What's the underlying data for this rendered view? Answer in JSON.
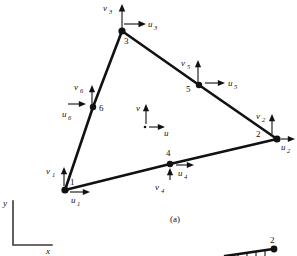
{
  "figure": {
    "caption_a": "(a)",
    "background_color": "#ffffff",
    "line_color": "#111111",
    "global_axes": {
      "x_label": "x",
      "y_label": "y"
    },
    "local_axes": {
      "u_label": "u",
      "v_label": "v"
    },
    "element_type": "six-node triangular element",
    "nodes": [
      {
        "id": "1",
        "label": "1",
        "x": 65,
        "y": 190,
        "u_label": "u",
        "u_sub": "1",
        "v_label": "v",
        "v_sub": "1",
        "u_dir": "right",
        "v_dir": "up"
      },
      {
        "id": "2",
        "label": "2",
        "x": 277,
        "y": 139,
        "u_label": "u",
        "u_sub": "2",
        "v_label": "v",
        "v_sub": "2",
        "u_dir": "right",
        "v_dir": "up"
      },
      {
        "id": "3",
        "label": "3",
        "x": 122,
        "y": 31,
        "u_label": "u",
        "u_sub": "3",
        "v_label": "v",
        "v_sub": "3",
        "u_dir": "right",
        "v_dir": "up"
      },
      {
        "id": "4",
        "label": "4",
        "x": 170,
        "y": 164,
        "u_label": "u",
        "u_sub": "4",
        "v_label": "v",
        "v_sub": "4",
        "u_dir": "right",
        "v_dir": "up"
      },
      {
        "id": "5",
        "label": "5",
        "x": 199,
        "y": 85,
        "u_label": "u",
        "u_sub": "5",
        "v_label": "v",
        "v_sub": "5",
        "u_dir": "right",
        "v_dir": "up"
      },
      {
        "id": "6",
        "label": "6",
        "x": 93,
        "y": 107,
        "u_label": "u",
        "u_sub": "6",
        "v_label": "v",
        "v_sub": "6",
        "u_dir": "right",
        "v_dir": "up"
      }
    ],
    "partial_figure_b": {
      "node_label": "2"
    }
  }
}
